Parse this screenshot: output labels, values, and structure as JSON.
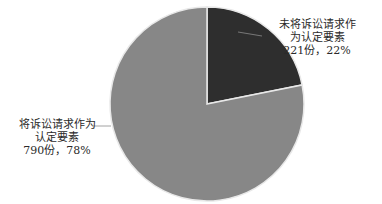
{
  "chart_data": {
    "type": "pie",
    "title": "",
    "categories": [
      "未将诉讼请求作为认定要素",
      "将诉讼请求作为认定要素"
    ],
    "values": [
      221,
      790
    ],
    "percentages": [
      22,
      78
    ],
    "colors": [
      "#2e2e2e",
      "#878787"
    ],
    "start_angle_deg": 0,
    "direction": "clockwise",
    "legend": "none",
    "labels": [
      {
        "line1": "未将诉讼请求作",
        "line2": "为认定要素",
        "line3": "221份，22%"
      },
      {
        "line1": "将诉讼请求作为",
        "line2": "认定要素",
        "line3": "790份，78%"
      }
    ]
  }
}
